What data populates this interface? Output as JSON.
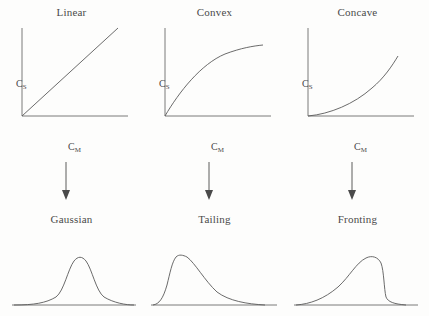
{
  "figure": {
    "caption_present": false,
    "background_color": "#fdfdfc",
    "line_color": "#5a5a5a",
    "text_color": "#4a4a4a"
  },
  "isotherms": [
    {
      "title": "Linear",
      "y_axis_label": "C",
      "y_axis_subscript": "S",
      "x_axis_label": "C",
      "x_axis_subscript": "M",
      "curve_shape": "straight-line",
      "path": "M 22 116 L 118 28"
    },
    {
      "title": "Convex",
      "y_axis_label": "C",
      "y_axis_subscript": "S",
      "x_axis_label": "C",
      "x_axis_subscript": "M",
      "curve_shape": "concave-down-saturating",
      "path": "M 22 116 C 36 92 58 64 82 54 C 98 48 110 46 120 45"
    },
    {
      "title": "Concave",
      "y_axis_label": "C",
      "y_axis_subscript": "S",
      "x_axis_label": "C",
      "x_axis_subscript": "M",
      "curve_shape": "concave-up-accelerating",
      "path": "M 22 116 C 44 114 68 104 86 88 C 98 78 106 66 112 56"
    }
  ],
  "axes": {
    "y_axis_path": "M 22 28 L 22 116",
    "x_axis_path": "M 22 116 L 128 116"
  },
  "arrows": [
    {
      "direction": "down",
      "from": "Linear",
      "to": "Gaussian"
    },
    {
      "direction": "down",
      "from": "Convex",
      "to": "Tailing"
    },
    {
      "direction": "down",
      "from": "Concave",
      "to": "Fronting"
    }
  ],
  "peaks": [
    {
      "title": "Gaussian",
      "shape": "symmetric",
      "description": "symmetric bell-shaped peak",
      "path": "M 14 76 C 34 76 46 74 56 68 C 64 62 68 40 74 32 C 78 27 82 27 86 32 C 92 40 96 62 104 68 C 114 74 126 76 134 76",
      "baseline_path": "M 12 76 L 136 76"
    },
    {
      "title": "Tailing",
      "shape": "right-skewed",
      "description": "sharp leading edge with long trailing tail",
      "path": "M 10 76 C 16 75 20 70 24 56 C 27 44 29 33 33 28 C 36 25 40 26 44 28 C 52 34 62 52 74 63 C 86 72 104 75 122 76",
      "baseline_path": "M 8 76 L 134 76"
    },
    {
      "title": "Fronting",
      "shape": "left-skewed",
      "description": "gradual leading edge with sharp trailing edge",
      "path": "M 10 76 C 24 75 38 70 52 58 C 64 47 70 34 80 29 C 86 26 92 28 95 34 C 98 42 98 60 100 68 C 102 73 108 75 120 76",
      "baseline_path": "M 8 76 L 132 76"
    }
  ]
}
